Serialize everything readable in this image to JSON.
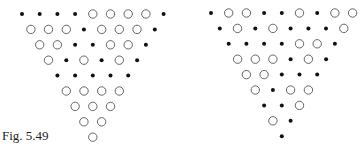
{
  "caption": "Fig. 5.49",
  "legend": {
    "filled": "black dot",
    "open": "open circle"
  },
  "triangles": [
    {
      "name": "left",
      "rows": [
        "FFFFOOOOF",
        "OOOFOOOF",
        "OOFFOOF",
        "OFOFOF",
        "FFFFF",
        "OOOO",
        "OOO",
        "OO",
        "O"
      ]
    },
    {
      "name": "right",
      "rows": [
        "FOOFFOFOO",
        "FOFOFFFO",
        "FFFFOOF",
        "OOOFOF",
        "OOFFF",
        "OFOO",
        "FFO",
        "OF",
        "F"
      ]
    }
  ]
}
